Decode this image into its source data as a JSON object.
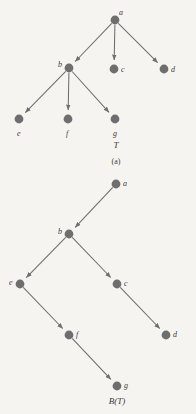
{
  "figure": {
    "background_color": "#f6f4f1",
    "node_color": "#6e6e6e",
    "edge_color": "#6e6e6e",
    "text_color": "#3a3a3a",
    "node_radius": 4.4
  },
  "panels": [
    {
      "id": "panel-a",
      "name": "tree-T",
      "title": "T",
      "title_pos": {
        "x": 116,
        "y": 148
      },
      "caption": "(a)",
      "caption_pos": {
        "x": 116,
        "y": 164
      },
      "nodes": [
        {
          "id": "a",
          "label": "a",
          "x": 115,
          "y": 20,
          "label_dx": 4,
          "label_dy": -5
        },
        {
          "id": "b",
          "label": "b",
          "x": 69,
          "y": 68,
          "label_dx": -11,
          "label_dy": -1
        },
        {
          "id": "c",
          "label": "c",
          "x": 114,
          "y": 69,
          "label_dx": 7,
          "label_dy": 3
        },
        {
          "id": "d",
          "label": "d",
          "x": 164,
          "y": 69,
          "label_dx": 7,
          "label_dy": 3
        },
        {
          "id": "e",
          "label": "e",
          "x": 19,
          "y": 119,
          "label_dx": -2,
          "label_dy": 17
        },
        {
          "id": "f",
          "label": "f",
          "x": 68,
          "y": 119,
          "label_dx": -2,
          "label_dy": 17
        },
        {
          "id": "g",
          "label": "g",
          "x": 115,
          "y": 119,
          "label_dx": -2,
          "label_dy": 17
        }
      ],
      "edges": [
        {
          "from": "a",
          "to": "b"
        },
        {
          "from": "a",
          "to": "c"
        },
        {
          "from": "a",
          "to": "d"
        },
        {
          "from": "b",
          "to": "e"
        },
        {
          "from": "b",
          "to": "f"
        },
        {
          "from": "b",
          "to": "g"
        }
      ]
    },
    {
      "id": "panel-b",
      "name": "tree-B-of-T",
      "title": "B(T)",
      "title_pos": {
        "x": 117,
        "y": 404
      },
      "caption": "",
      "caption_pos": {
        "x": 117,
        "y": 414
      },
      "nodes": [
        {
          "id": "a",
          "label": "a",
          "x": 116,
          "y": 184,
          "label_dx": 7,
          "label_dy": 2
        },
        {
          "id": "b",
          "label": "b",
          "x": 69,
          "y": 234,
          "label_dx": -11,
          "label_dy": 0
        },
        {
          "id": "e",
          "label": "e",
          "x": 20,
          "y": 284,
          "label_dx": -11,
          "label_dy": 1
        },
        {
          "id": "c",
          "label": "c",
          "x": 117,
          "y": 284,
          "label_dx": 7,
          "label_dy": 2
        },
        {
          "id": "f",
          "label": "f",
          "x": 69,
          "y": 335,
          "label_dx": 7,
          "label_dy": 2
        },
        {
          "id": "d",
          "label": "d",
          "x": 166,
          "y": 335,
          "label_dx": 7,
          "label_dy": 2
        },
        {
          "id": "g",
          "label": "g",
          "x": 117,
          "y": 386,
          "label_dx": 7,
          "label_dy": 2
        }
      ],
      "edges": [
        {
          "from": "a",
          "to": "b"
        },
        {
          "from": "b",
          "to": "e"
        },
        {
          "from": "b",
          "to": "c"
        },
        {
          "from": "e",
          "to": "f"
        },
        {
          "from": "c",
          "to": "d"
        },
        {
          "from": "f",
          "to": "g"
        }
      ]
    }
  ]
}
